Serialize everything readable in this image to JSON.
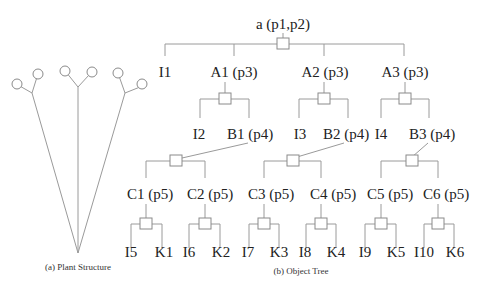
{
  "figure": {
    "plant": {
      "caption": "(a) Plant Structure"
    },
    "tree": {
      "caption": "(b) Object  Tree",
      "root": "a (p1,p2)",
      "level1": [
        "I1",
        "A1 (p3)",
        "A2 (p3)",
        "A3 (p3)"
      ],
      "level2": [
        "I2",
        "B1 (p4)",
        "I3",
        "B2 (p4)",
        "I4",
        "B3 (p4)"
      ],
      "level3": [
        "C1 (p5)",
        "C2 (p5)",
        "C3 (p5)",
        "C4 (p5)",
        "C5 (p5)",
        "C6 (p5)"
      ],
      "level4": [
        "I5",
        "K1",
        "I6",
        "K2",
        "I7",
        "K3",
        "I8",
        "K4",
        "I9",
        "K5",
        "I10",
        "K6"
      ]
    }
  }
}
